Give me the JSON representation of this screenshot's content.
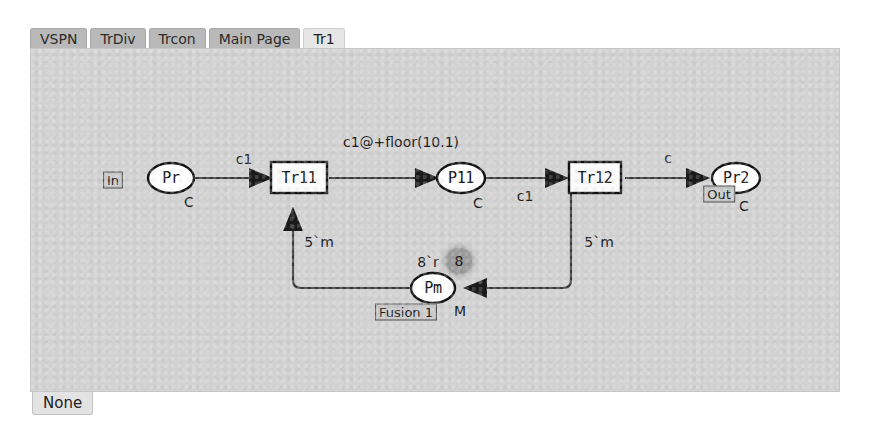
{
  "tabs": {
    "items": [
      {
        "label": "VSPN",
        "active": false
      },
      {
        "label": "TrDiv",
        "active": false
      },
      {
        "label": "Trcon",
        "active": false
      },
      {
        "label": "Main Page",
        "active": false
      },
      {
        "label": "Tr1",
        "active": true
      }
    ]
  },
  "statusbar": {
    "label": "None"
  },
  "colors": {
    "canvas_bg": "#d2d2d2",
    "tab_inactive": "#b9b9b9",
    "tab_active": "#e6e6e6",
    "stroke": "#1a1a1a",
    "token_fill": "#9a9a9a"
  },
  "diagram": {
    "type": "petri-net",
    "nodes": [
      {
        "id": "Pr",
        "kind": "place",
        "label": "Pr",
        "x": 170,
        "y": 177,
        "rx": 23,
        "ry": 15,
        "type_label": "C",
        "port_label": "In"
      },
      {
        "id": "Tr11",
        "kind": "transition",
        "label": "Tr11",
        "x": 298,
        "y": 177,
        "w": 56,
        "h": 31
      },
      {
        "id": "P11",
        "kind": "place",
        "label": "P11",
        "x": 460,
        "y": 177,
        "rx": 24,
        "ry": 15,
        "type_label": "C"
      },
      {
        "id": "Tr12",
        "kind": "transition",
        "label": "Tr12",
        "x": 594,
        "y": 177,
        "w": 52,
        "h": 31
      },
      {
        "id": "Pr2",
        "kind": "place",
        "label": "Pr2",
        "x": 735,
        "y": 177,
        "rx": 24,
        "ry": 15,
        "type_label": "C",
        "port_label": "Out"
      },
      {
        "id": "Pm",
        "kind": "place",
        "label": "Pm",
        "x": 432,
        "y": 287,
        "rx": 22,
        "ry": 15,
        "type_label": "M",
        "fusion_label": "Fusion 1",
        "marking": "8`r",
        "token_count": "8"
      }
    ],
    "arcs": [
      {
        "from": "Pr",
        "to": "Tr11",
        "label": "c1",
        "label_x": 243,
        "label_y": 158
      },
      {
        "from": "Tr11",
        "to": "P11",
        "label": "c1@+floor(10.1)",
        "label_x": 400,
        "label_y": 141
      },
      {
        "from": "P11",
        "to": "Tr12",
        "label": "c1",
        "label_x": 524,
        "label_y": 195
      },
      {
        "from": "Tr12",
        "to": "Pr2",
        "label": "c",
        "label_x": 667,
        "label_y": 157
      },
      {
        "from": "Pm",
        "to": "Tr11",
        "label": "5`m",
        "label_x": 318,
        "label_y": 241
      },
      {
        "from": "Tr12",
        "to": "Pm",
        "label": "5`m",
        "label_x": 568,
        "label_y": 241
      }
    ]
  }
}
